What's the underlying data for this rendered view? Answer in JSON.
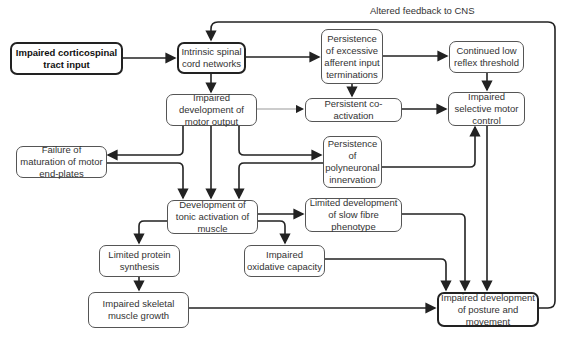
{
  "diagram": {
    "feedback_label": "Altered feedback to CNS",
    "nodes": {
      "corticospinal": "Impaired corticospinal tract input",
      "spinal_networks": "Intrinsic spinal cord networks",
      "afferent_persistence": "Persistence of excessive afferent input terminations",
      "low_reflex": "Continued low reflex threshold",
      "motor_output": "Impaired development of motor output",
      "coactivation": "Persistent co-activation",
      "selective_control": "Impaired selective motor control",
      "end_plates": "Failure of maturation of motor end-plates",
      "polyneuronal": "Persistence of polyneuronal innervation",
      "tonic_activation": "Development of tonic activation of muscle",
      "slow_fibre": "Limited development of slow fibre phenotype",
      "protein_synthesis": "Limited protein synthesis",
      "oxidative_capacity": "Impaired oxidative capacity",
      "muscle_growth": "Impaired skeletal muscle growth",
      "posture_movement": "Impaired development of posture and movement"
    },
    "edges": [
      [
        "corticospinal",
        "spinal_networks"
      ],
      [
        "spinal_networks",
        "afferent_persistence"
      ],
      [
        "spinal_networks",
        "motor_output"
      ],
      [
        "afferent_persistence",
        "low_reflex"
      ],
      [
        "afferent_persistence",
        "coactivation"
      ],
      [
        "low_reflex",
        "selective_control"
      ],
      [
        "motor_output",
        "coactivation"
      ],
      [
        "coactivation",
        "selective_control"
      ],
      [
        "motor_output",
        "end_plates"
      ],
      [
        "motor_output",
        "polyneuronal"
      ],
      [
        "motor_output",
        "tonic_activation"
      ],
      [
        "end_plates",
        "tonic_activation"
      ],
      [
        "polyneuronal",
        "tonic_activation"
      ],
      [
        "polyneuronal",
        "selective_control"
      ],
      [
        "selective_control",
        "posture_movement"
      ],
      [
        "tonic_activation",
        "slow_fibre"
      ],
      [
        "tonic_activation",
        "oxidative_capacity"
      ],
      [
        "tonic_activation",
        "protein_synthesis"
      ],
      [
        "protein_synthesis",
        "muscle_growth"
      ],
      [
        "muscle_growth",
        "posture_movement"
      ],
      [
        "oxidative_capacity",
        "posture_movement"
      ],
      [
        "slow_fibre",
        "posture_movement"
      ],
      [
        "posture_movement",
        "spinal_networks"
      ]
    ]
  }
}
